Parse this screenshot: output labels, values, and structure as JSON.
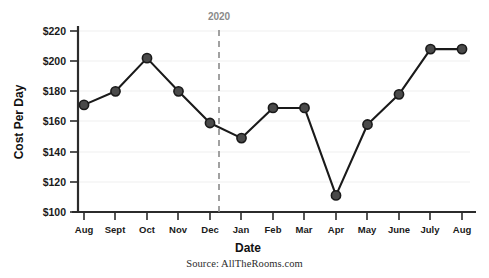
{
  "chart_data": {
    "type": "line",
    "title": "",
    "xlabel": "Date",
    "ylabel": "Cost Per Day",
    "categories": [
      "Aug",
      "Sept",
      "Oct",
      "Nov",
      "Dec",
      "Jan",
      "Feb",
      "Mar",
      "Apr",
      "May",
      "June",
      "July",
      "Aug"
    ],
    "values": [
      171,
      180,
      202,
      180,
      159,
      149,
      169,
      169,
      111,
      158,
      178,
      208,
      208
    ],
    "ylim": [
      100,
      220
    ],
    "ytick_values": [
      100,
      120,
      140,
      160,
      180,
      200,
      220
    ],
    "ytick_labels": [
      "$100",
      "$120",
      "$140",
      "$160",
      "$180",
      "$200",
      "$220"
    ],
    "grid": true,
    "legend": "none",
    "marker": "circle",
    "annotations": [
      {
        "label": "2020",
        "type": "vertical-dashed-line",
        "between": [
          "Dec",
          "Jan"
        ]
      }
    ],
    "series_color": "#4a4a4a",
    "line_color": "#1a1a1a",
    "grid_color": "#efefef",
    "annotation_color": "#8a8a8a"
  },
  "source": {
    "text": "Source: AllTheRooms.com"
  }
}
